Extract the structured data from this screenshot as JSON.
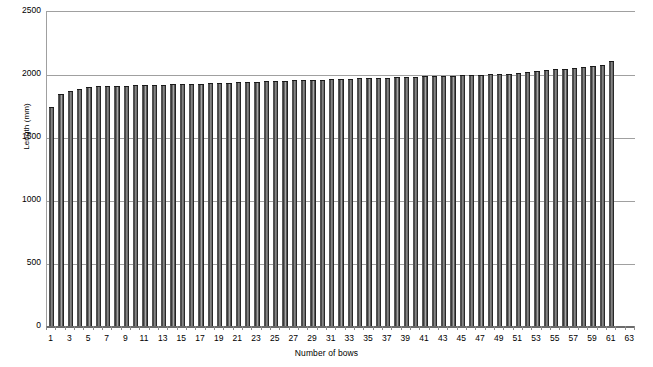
{
  "chart_data": {
    "type": "bar",
    "title": "",
    "xlabel": "Number of bows",
    "ylabel": "Length (mm)",
    "ylim": [
      0,
      2500
    ],
    "xlim": [
      0,
      63
    ],
    "grid": true,
    "legend": false,
    "y_ticks": [
      0,
      500,
      1000,
      1500,
      2000,
      2500
    ],
    "y_tick_labels": [
      "0",
      "500",
      "1000",
      "1500",
      "2000",
      "2500"
    ],
    "x_tick_labels": [
      "1",
      "3",
      "5",
      "7",
      "9",
      "11",
      "13",
      "15",
      "17",
      "19",
      "21",
      "23",
      "25",
      "27",
      "29",
      "31",
      "33",
      "35",
      "37",
      "39",
      "41",
      "43",
      "45",
      "47",
      "49",
      "51",
      "53",
      "55",
      "57",
      "59",
      "61",
      "63"
    ],
    "categories": [
      1,
      2,
      3,
      4,
      5,
      6,
      7,
      8,
      9,
      10,
      11,
      12,
      13,
      14,
      15,
      16,
      17,
      18,
      19,
      20,
      21,
      22,
      23,
      24,
      25,
      26,
      27,
      28,
      29,
      30,
      31,
      32,
      33,
      34,
      35,
      36,
      37,
      38,
      39,
      40,
      41,
      42,
      43,
      44,
      45,
      46,
      47,
      48,
      49,
      50,
      51,
      52,
      53,
      54,
      55,
      56,
      57,
      58,
      59,
      60,
      61
    ],
    "values": [
      1746,
      1850,
      1873,
      1889,
      1905,
      1913,
      1913,
      1913,
      1913,
      1921,
      1921,
      1921,
      1921,
      1929,
      1929,
      1929,
      1929,
      1937,
      1937,
      1937,
      1944,
      1944,
      1944,
      1952,
      1952,
      1952,
      1960,
      1960,
      1960,
      1960,
      1968,
      1968,
      1968,
      1976,
      1976,
      1976,
      1976,
      1984,
      1984,
      1984,
      1992,
      1992,
      1992,
      1992,
      2000,
      2000,
      2000,
      2008,
      2008,
      2008,
      2016,
      2024,
      2032,
      2040,
      2048,
      2048,
      2056,
      2064,
      2071,
      2079,
      2111
    ],
    "bar_color": "#333333",
    "gridline_color": "#a0a0a0",
    "axis_color": "#6b6b6b",
    "background": "#ffffff"
  },
  "chart_meta": {
    "plot_left_px": 46,
    "plot_top_px": 11,
    "plot_width_px": 588,
    "plot_height_px": 315
  }
}
